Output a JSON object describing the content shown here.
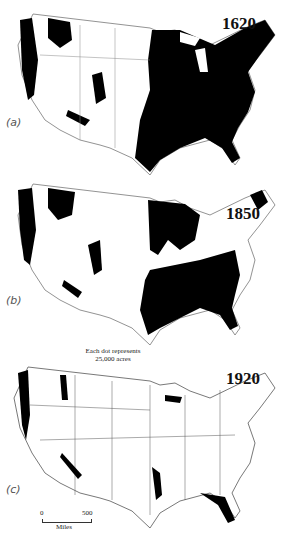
{
  "figure": {
    "panels": [
      {
        "id": "a",
        "label": "(a)",
        "year": "1620"
      },
      {
        "id": "b",
        "label": "(b)",
        "year": "1850"
      },
      {
        "id": "c",
        "label": "(c)",
        "year": "1920"
      }
    ],
    "legend": {
      "line1": "Each dot represents",
      "line2": "25,000 acres"
    },
    "scale": {
      "start": "0",
      "end": "500",
      "unit": "Miles"
    }
  },
  "colors": {
    "forest": "#000000",
    "border": "#666666",
    "background": "#ffffff"
  }
}
